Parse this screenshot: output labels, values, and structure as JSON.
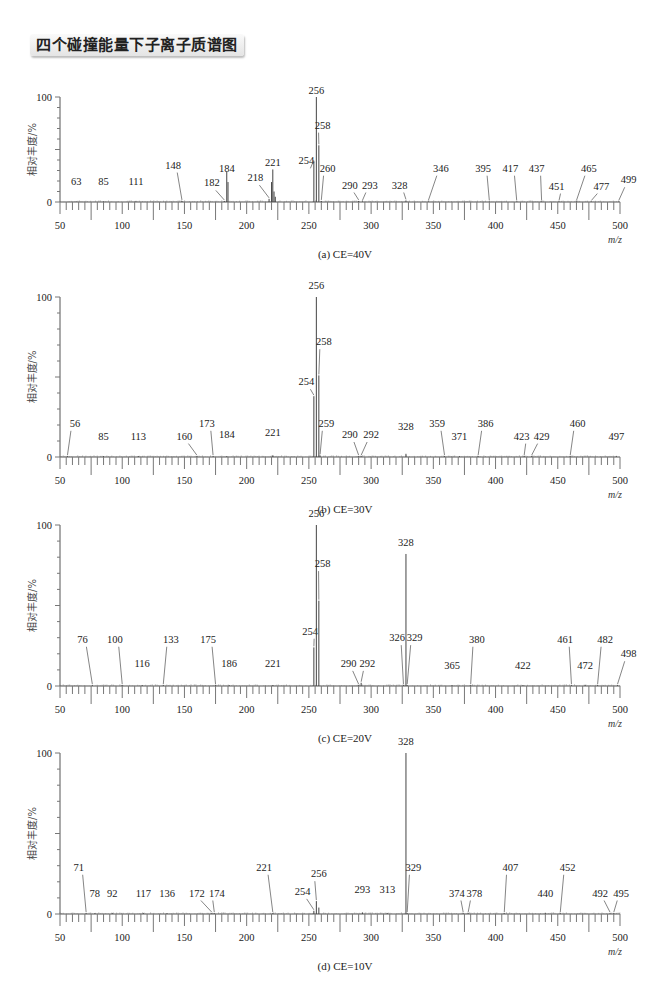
{
  "page_title": "四个碰撞能量下子离子质谱图",
  "chart_data": [
    {
      "type": "bar",
      "title": "(a) CE=40V",
      "xlabel": "m/z",
      "ylabel": "相对丰度/%",
      "xlim": [
        50,
        500
      ],
      "ylim": [
        0,
        100
      ],
      "xticks": [
        50,
        100,
        150,
        200,
        250,
        300,
        350,
        400,
        450,
        500
      ],
      "yticks": [
        0,
        100
      ],
      "peaks": [
        {
          "mz": 63,
          "intensity": 0.5,
          "label": "63",
          "lx": 63,
          "ly": 13
        },
        {
          "mz": 85,
          "intensity": 0.5,
          "label": "85",
          "lx": 85,
          "ly": 13
        },
        {
          "mz": 111,
          "intensity": 0.5,
          "label": "111",
          "lx": 111,
          "ly": 13
        },
        {
          "mz": 148,
          "intensity": 1,
          "label": "148",
          "lx": 141,
          "ly": 29
        },
        {
          "mz": 182,
          "intensity": 1,
          "label": "182",
          "lx": 172,
          "ly": 12
        },
        {
          "mz": 184,
          "intensity": 29,
          "label": "184",
          "lx": 184,
          "ly": 26
        },
        {
          "mz": 185,
          "intensity": 19,
          "label": "",
          "lx": 0,
          "ly": 0
        },
        {
          "mz": 218,
          "intensity": 3,
          "label": "218",
          "lx": 207,
          "ly": 17
        },
        {
          "mz": 220,
          "intensity": 19,
          "label": "",
          "lx": 0,
          "ly": 0
        },
        {
          "mz": 221,
          "intensity": 31,
          "label": "221",
          "lx": 221,
          "ly": 31
        },
        {
          "mz": 222,
          "intensity": 10,
          "label": "",
          "lx": 0,
          "ly": 0
        },
        {
          "mz": 223,
          "intensity": 5,
          "label": "",
          "lx": 0,
          "ly": 0
        },
        {
          "mz": 254,
          "intensity": 39,
          "label": "254",
          "lx": 248,
          "ly": 33
        },
        {
          "mz": 256,
          "intensity": 100,
          "label": "256",
          "lx": 256,
          "ly": 100
        },
        {
          "mz": 258,
          "intensity": 54,
          "label": "258",
          "lx": 261,
          "ly": 67
        },
        {
          "mz": 260,
          "intensity": 1,
          "label": "260",
          "lx": 265,
          "ly": 26
        },
        {
          "mz": 290,
          "intensity": 1,
          "label": "290",
          "lx": 283,
          "ly": 10
        },
        {
          "mz": 293,
          "intensity": 0.5,
          "label": "293",
          "lx": 299,
          "ly": 10
        },
        {
          "mz": 328,
          "intensity": 1.5,
          "label": "328",
          "lx": 323,
          "ly": 10
        },
        {
          "mz": 346,
          "intensity": 0.5,
          "label": "346",
          "lx": 356,
          "ly": 26
        },
        {
          "mz": 395,
          "intensity": 0.5,
          "label": "395",
          "lx": 390,
          "ly": 26
        },
        {
          "mz": 417,
          "intensity": 0.5,
          "label": "417",
          "lx": 412,
          "ly": 26
        },
        {
          "mz": 437,
          "intensity": 0.5,
          "label": "437",
          "lx": 433,
          "ly": 26
        },
        {
          "mz": 451,
          "intensity": 0.5,
          "label": "451",
          "lx": 449,
          "ly": 9
        },
        {
          "mz": 465,
          "intensity": 0.5,
          "label": "465",
          "lx": 475,
          "ly": 26
        },
        {
          "mz": 477,
          "intensity": 0.5,
          "label": "477",
          "lx": 485,
          "ly": 9
        },
        {
          "mz": 499,
          "intensity": 0.5,
          "label": "499",
          "lx": 507,
          "ly": 15
        }
      ]
    },
    {
      "type": "bar",
      "title": "(b) CE=30V",
      "xlabel": "m/z",
      "ylabel": "相对丰度/%",
      "xlim": [
        50,
        500
      ],
      "ylim": [
        0,
        100
      ],
      "xticks": [
        50,
        100,
        150,
        200,
        250,
        300,
        350,
        400,
        450,
        500
      ],
      "yticks": [
        0,
        100
      ],
      "peaks": [
        {
          "mz": 56,
          "intensity": 0.5,
          "label": "56",
          "lx": 62,
          "ly": 17
        },
        {
          "mz": 85,
          "intensity": 0.5,
          "label": "85",
          "lx": 85,
          "ly": 9
        },
        {
          "mz": 113,
          "intensity": 0.5,
          "label": "113",
          "lx": 113,
          "ly": 9
        },
        {
          "mz": 160,
          "intensity": 0.5,
          "label": "160",
          "lx": 150,
          "ly": 9
        },
        {
          "mz": 173,
          "intensity": 0.5,
          "label": "173",
          "lx": 168,
          "ly": 17
        },
        {
          "mz": 184,
          "intensity": 0.5,
          "label": "184",
          "lx": 184,
          "ly": 10
        },
        {
          "mz": 221,
          "intensity": 1,
          "label": "221",
          "lx": 221,
          "ly": 11
        },
        {
          "mz": 254,
          "intensity": 38,
          "label": "254",
          "lx": 248,
          "ly": 43
        },
        {
          "mz": 256,
          "intensity": 100,
          "label": "256",
          "lx": 256,
          "ly": 103
        },
        {
          "mz": 258,
          "intensity": 51,
          "label": "258",
          "lx": 262,
          "ly": 68
        },
        {
          "mz": 259,
          "intensity": 1,
          "label": "259",
          "lx": 264,
          "ly": 17
        },
        {
          "mz": 290,
          "intensity": 0.5,
          "label": "290",
          "lx": 283,
          "ly": 10
        },
        {
          "mz": 292,
          "intensity": 0.5,
          "label": "292",
          "lx": 300,
          "ly": 10
        },
        {
          "mz": 328,
          "intensity": 2,
          "label": "328",
          "lx": 328,
          "ly": 15
        },
        {
          "mz": 359,
          "intensity": 0.5,
          "label": "359",
          "lx": 353,
          "ly": 17
        },
        {
          "mz": 371,
          "intensity": 0.5,
          "label": "371",
          "lx": 371,
          "ly": 9
        },
        {
          "mz": 386,
          "intensity": 0.5,
          "label": "386",
          "lx": 392,
          "ly": 17
        },
        {
          "mz": 423,
          "intensity": 0.5,
          "label": "423",
          "lx": 421,
          "ly": 9
        },
        {
          "mz": 429,
          "intensity": 0.5,
          "label": "429",
          "lx": 437,
          "ly": 9
        },
        {
          "mz": 460,
          "intensity": 0.5,
          "label": "460",
          "lx": 466,
          "ly": 17
        },
        {
          "mz": 497,
          "intensity": 0.5,
          "label": "497",
          "lx": 497,
          "ly": 9
        }
      ]
    },
    {
      "type": "bar",
      "title": "(c) CE=20V",
      "xlabel": "m/z",
      "ylabel": "相对丰度/%",
      "xlim": [
        50,
        500
      ],
      "ylim": [
        0,
        100
      ],
      "xticks": [
        50,
        100,
        150,
        200,
        250,
        300,
        350,
        400,
        450,
        500
      ],
      "yticks": [
        0,
        100
      ],
      "peaks": [
        {
          "mz": 76,
          "intensity": 0.5,
          "label": "76",
          "lx": 68,
          "ly": 25
        },
        {
          "mz": 100,
          "intensity": 0.5,
          "label": "100",
          "lx": 94,
          "ly": 25
        },
        {
          "mz": 116,
          "intensity": 0.5,
          "label": "116",
          "lx": 116,
          "ly": 10
        },
        {
          "mz": 133,
          "intensity": 0.5,
          "label": "133",
          "lx": 139,
          "ly": 25
        },
        {
          "mz": 175,
          "intensity": 0.5,
          "label": "175",
          "lx": 169,
          "ly": 25
        },
        {
          "mz": 186,
          "intensity": 0.5,
          "label": "186",
          "lx": 186,
          "ly": 10
        },
        {
          "mz": 221,
          "intensity": 0.5,
          "label": "221",
          "lx": 221,
          "ly": 10
        },
        {
          "mz": 254,
          "intensity": 24,
          "label": "254",
          "lx": 251,
          "ly": 30
        },
        {
          "mz": 256,
          "intensity": 100,
          "label": "256",
          "lx": 256,
          "ly": 103
        },
        {
          "mz": 258,
          "intensity": 53,
          "label": "258",
          "lx": 261,
          "ly": 72
        },
        {
          "mz": 290,
          "intensity": 0.5,
          "label": "290",
          "lx": 282,
          "ly": 10
        },
        {
          "mz": 292,
          "intensity": 2,
          "label": "292",
          "lx": 297,
          "ly": 10
        },
        {
          "mz": 326,
          "intensity": 0.5,
          "label": "326",
          "lx": 321,
          "ly": 26
        },
        {
          "mz": 328,
          "intensity": 82,
          "label": "328",
          "lx": 328,
          "ly": 85
        },
        {
          "mz": 329,
          "intensity": 0.5,
          "label": "329",
          "lx": 335,
          "ly": 26
        },
        {
          "mz": 365,
          "intensity": 0.5,
          "label": "365",
          "lx": 365,
          "ly": 9
        },
        {
          "mz": 380,
          "intensity": 0.5,
          "label": "380",
          "lx": 385,
          "ly": 25
        },
        {
          "mz": 422,
          "intensity": 0.5,
          "label": "422",
          "lx": 422,
          "ly": 9
        },
        {
          "mz": 461,
          "intensity": 0.5,
          "label": "461",
          "lx": 456,
          "ly": 25
        },
        {
          "mz": 472,
          "intensity": 0.5,
          "label": "472",
          "lx": 472,
          "ly": 9
        },
        {
          "mz": 482,
          "intensity": 0.5,
          "label": "482",
          "lx": 488,
          "ly": 25
        },
        {
          "mz": 498,
          "intensity": 0.5,
          "label": "498",
          "lx": 507,
          "ly": 16
        }
      ]
    },
    {
      "type": "bar",
      "title": "(d) CE=10V",
      "xlabel": "m/z",
      "ylabel": "相对丰度/%",
      "xlim": [
        50,
        500
      ],
      "ylim": [
        0,
        100
      ],
      "xticks": [
        50,
        100,
        150,
        200,
        250,
        300,
        350,
        400,
        450,
        500
      ],
      "yticks": [
        0,
        100
      ],
      "peaks": [
        {
          "mz": 71,
          "intensity": 0.5,
          "label": "71",
          "lx": 65,
          "ly": 25
        },
        {
          "mz": 78,
          "intensity": 0.5,
          "label": "78",
          "lx": 78,
          "ly": 9
        },
        {
          "mz": 92,
          "intensity": 0.5,
          "label": "92",
          "lx": 92,
          "ly": 9
        },
        {
          "mz": 117,
          "intensity": 0.5,
          "label": "117",
          "lx": 117,
          "ly": 9
        },
        {
          "mz": 136,
          "intensity": 0.5,
          "label": "136",
          "lx": 136,
          "ly": 9
        },
        {
          "mz": 172,
          "intensity": 0.5,
          "label": "172",
          "lx": 160,
          "ly": 9
        },
        {
          "mz": 174,
          "intensity": 0.5,
          "label": "174",
          "lx": 176,
          "ly": 9
        },
        {
          "mz": 221,
          "intensity": 0.5,
          "label": "221",
          "lx": 214,
          "ly": 25
        },
        {
          "mz": 254,
          "intensity": 2,
          "label": "254",
          "lx": 245,
          "ly": 10
        },
        {
          "mz": 256,
          "intensity": 8,
          "label": "256",
          "lx": 258,
          "ly": 21
        },
        {
          "mz": 258,
          "intensity": 4,
          "label": "",
          "lx": 0,
          "ly": 0
        },
        {
          "mz": 293,
          "intensity": 1,
          "label": "293",
          "lx": 293,
          "ly": 11
        },
        {
          "mz": 313,
          "intensity": 0.5,
          "label": "313",
          "lx": 313,
          "ly": 11
        },
        {
          "mz": 328,
          "intensity": 100,
          "label": "328",
          "lx": 328,
          "ly": 103
        },
        {
          "mz": 329,
          "intensity": 0.5,
          "label": "329",
          "lx": 334,
          "ly": 25
        },
        {
          "mz": 374,
          "intensity": 0.5,
          "label": "374",
          "lx": 369,
          "ly": 9
        },
        {
          "mz": 378,
          "intensity": 0.5,
          "label": "378",
          "lx": 383,
          "ly": 9
        },
        {
          "mz": 407,
          "intensity": 0.5,
          "label": "407",
          "lx": 412,
          "ly": 25
        },
        {
          "mz": 440,
          "intensity": 0.5,
          "label": "440",
          "lx": 440,
          "ly": 9
        },
        {
          "mz": 452,
          "intensity": 0.5,
          "label": "452",
          "lx": 458,
          "ly": 25
        },
        {
          "mz": 492,
          "intensity": 0.5,
          "label": "492",
          "lx": 484,
          "ly": 9
        },
        {
          "mz": 495,
          "intensity": 0.5,
          "label": "495",
          "lx": 501,
          "ly": 9
        }
      ]
    }
  ],
  "panels_layout": [
    {
      "top": 97,
      "bottom": 202
    },
    {
      "top": 297,
      "bottom": 457
    },
    {
      "top": 525,
      "bottom": 686
    },
    {
      "top": 753,
      "bottom": 914
    }
  ]
}
